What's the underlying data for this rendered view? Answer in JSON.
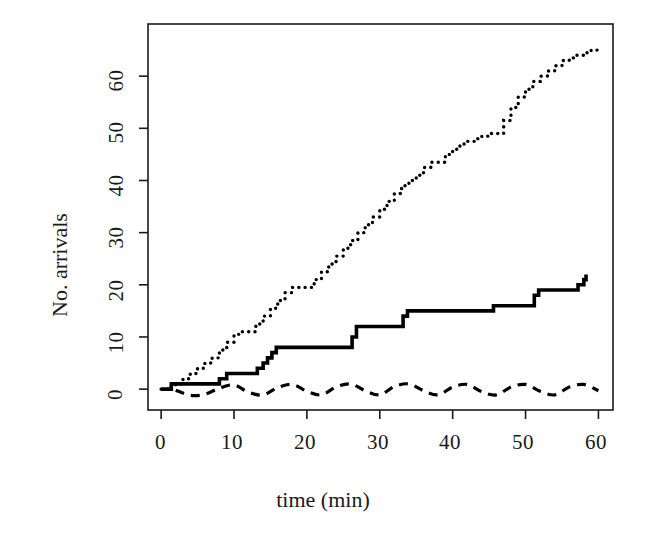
{
  "chart_data": {
    "type": "line",
    "title": "",
    "xlabel": "time (min)",
    "ylabel": "No. arrivals",
    "xlim": [
      -1.8,
      62.0
    ],
    "ylim": [
      -4.0,
      70.0
    ],
    "xticks": [
      0,
      10,
      20,
      30,
      40,
      50,
      60
    ],
    "xtick_labels": [
      "0",
      "10",
      "20",
      "30",
      "40",
      "50",
      "60"
    ],
    "yticks": [
      0,
      10,
      20,
      30,
      40,
      50,
      60
    ],
    "ytick_labels": [
      "0",
      "10",
      "20",
      "30",
      "40",
      "50",
      "60"
    ],
    "grid": false,
    "legend": null,
    "box": true,
    "series": [
      {
        "name": "dotted-cumulative-arrivals",
        "style": "dotted",
        "linetype": "step",
        "color": "#000000",
        "x": [
          0.0,
          1.0,
          2.0,
          3.0,
          4.0,
          5.0,
          6.0,
          7.0,
          8.0,
          9.0,
          10.0,
          11.0,
          12.0,
          13.0,
          14.0,
          15.0,
          16.0,
          17.0,
          18.0,
          19.0,
          20.0,
          21.0,
          22.0,
          23.0,
          24.0,
          25.0,
          26.0,
          27.0,
          28.0,
          29.0,
          30.0,
          31.0,
          32.0,
          33.0,
          34.0,
          35.0,
          36.0,
          37.0,
          38.0,
          39.0,
          40.0,
          41.0,
          42.0,
          43.0,
          44.0,
          45.0,
          46.0,
          47.0,
          48.0,
          49.0,
          50.0,
          51.0,
          52.0,
          53.0,
          54.0,
          55.0,
          56.0,
          57.0,
          58.0,
          59.0,
          60.0
        ],
        "y": [
          0.0,
          0.5,
          1.0,
          2.0,
          3.0,
          4.0,
          5.0,
          6.0,
          7.5,
          9.0,
          10.5,
          11.0,
          11.0,
          12.5,
          14.0,
          15.5,
          17.0,
          18.5,
          19.5,
          19.5,
          19.5,
          21.0,
          22.5,
          24.0,
          25.5,
          27.0,
          28.5,
          30.0,
          31.5,
          33.0,
          34.5,
          36.0,
          37.5,
          39.0,
          40.0,
          41.0,
          42.5,
          43.5,
          43.5,
          45.0,
          46.0,
          47.0,
          47.5,
          48.0,
          48.5,
          49.0,
          49.0,
          51.5,
          54.0,
          56.0,
          57.5,
          59.0,
          60.0,
          61.0,
          62.0,
          63.0,
          63.5,
          64.0,
          64.5,
          65.0,
          65.5
        ]
      },
      {
        "name": "solid-step-arrivals",
        "style": "solid",
        "linetype": "step",
        "color": "#000000",
        "x": [
          0.0,
          0.8,
          1.4,
          2.0,
          7.5,
          8.0,
          9.0,
          12.5,
          13.2,
          14.0,
          14.6,
          15.2,
          15.8,
          25.5,
          26.2,
          26.8,
          32.5,
          33.2,
          33.8,
          40.0,
          45.0,
          45.6,
          50.5,
          51.2,
          51.8,
          56.5,
          57.2,
          58.0,
          58.3
        ],
        "y": [
          0.0,
          0.0,
          1.0,
          1.0,
          1.0,
          2.0,
          3.0,
          3.0,
          4.0,
          5.0,
          6.0,
          7.0,
          8.0,
          8.0,
          10.0,
          12.0,
          12.0,
          14.0,
          15.0,
          15.0,
          15.0,
          16.0,
          16.0,
          18.0,
          19.0,
          19.0,
          20.0,
          21.0,
          22.0
        ]
      },
      {
        "name": "dashed-residual-oscillation",
        "style": "dashed",
        "linetype": "wave",
        "color": "#000000",
        "x": [
          2.0,
          4.0,
          6.0,
          8.0,
          10.0,
          12.0,
          14.0,
          16.0,
          18.0,
          20.0,
          22.0,
          24.0,
          26.0,
          28.0,
          30.0,
          32.0,
          34.0,
          36.0,
          38.0,
          40.0,
          42.0,
          44.0,
          46.0,
          48.0,
          50.0,
          52.0,
          54.0,
          56.0,
          58.0,
          60.0
        ],
        "y": [
          -0.2,
          -1.2,
          -1.0,
          0.2,
          0.8,
          -0.6,
          -1.1,
          0.3,
          0.9,
          -0.4,
          -1.1,
          0.4,
          1.0,
          -0.3,
          -1.1,
          0.5,
          1.0,
          -0.3,
          -1.1,
          0.4,
          0.9,
          -0.5,
          -1.1,
          0.4,
          0.9,
          -0.4,
          -1.1,
          0.4,
          0.9,
          -0.3
        ]
      }
    ]
  },
  "axes": {
    "x_title": "time (min)",
    "y_title": "No. arrivals",
    "x_tick_labels": [
      "0",
      "10",
      "20",
      "30",
      "40",
      "50",
      "60"
    ],
    "y_tick_labels": [
      "0",
      "10",
      "20",
      "30",
      "40",
      "50",
      "60"
    ]
  },
  "style": {
    "background": "#ffffff",
    "foreground": "#1a1a1a",
    "line_color": "#111111"
  }
}
